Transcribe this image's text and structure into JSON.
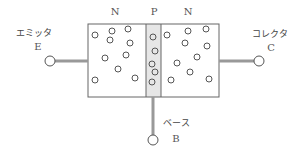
{
  "diagram": {
    "regions": [
      {
        "label": "N",
        "x": 115
      },
      {
        "label": "P",
        "x": 154
      },
      {
        "label": "N",
        "x": 188
      }
    ],
    "terminals": {
      "emitter": {
        "name_jp": "エミッタ",
        "symbol": "E"
      },
      "collector": {
        "name_jp": "コレクタ",
        "symbol": "C"
      },
      "base": {
        "name_jp": "ベース",
        "symbol": "B"
      }
    },
    "colors": {
      "outline": "#666666",
      "lead": "#999999",
      "p_region_fill": "#e6e6e6",
      "carrier": "#555555"
    },
    "carriers": {
      "left_n": [
        [
          95,
          35
        ],
        [
          112,
          31
        ],
        [
          128,
          29
        ],
        [
          110,
          40
        ],
        [
          130,
          43
        ],
        [
          105,
          58
        ],
        [
          126,
          55
        ],
        [
          118,
          69
        ],
        [
          95,
          80
        ],
        [
          135,
          78
        ]
      ],
      "p": [
        [
          153,
          37
        ],
        [
          155,
          51
        ],
        [
          152,
          64
        ],
        [
          155,
          72
        ],
        [
          152,
          82
        ]
      ],
      "right_n": [
        [
          167,
          35
        ],
        [
          188,
          31
        ],
        [
          206,
          29
        ],
        [
          185,
          43
        ],
        [
          207,
          46
        ],
        [
          177,
          63
        ],
        [
          197,
          57
        ],
        [
          190,
          72
        ],
        [
          171,
          80
        ],
        [
          209,
          79
        ]
      ]
    }
  }
}
